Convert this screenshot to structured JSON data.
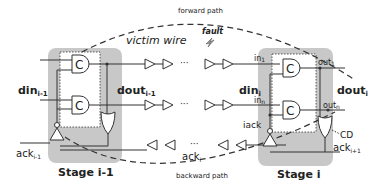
{
  "labels": {
    "forward_path": "forward path",
    "backward_path": "backward path",
    "victim_wire": "victim wire",
    "fault": "fault",
    "din_prev": "din",
    "din_prev_sub": "i-1",
    "dout_prev": "dout",
    "dout_prev_sub": "i-1",
    "din_cur": "din",
    "din_cur_sub": "i",
    "dout_cur": "dout",
    "dout_cur_sub": "i",
    "in1": "in",
    "in1_sub": "1",
    "inn": "in",
    "inn_sub": "n",
    "out1": "out",
    "out1_sub": "1",
    "outn": "out",
    "outn_sub": "n",
    "iack": "iack",
    "cd": "CD",
    "ack_prev": "ack",
    "ack_prev_sub": "i-1",
    "ack_cur": "ack",
    "ack_cur_sub": "i",
    "ack_next": "ack",
    "ack_next_sub": "i+1",
    "stage_prev": "Stage i-1",
    "stage_cur": "Stage i",
    "c_gate": "C",
    "ellipsis": "···",
    "vdots": "⋮"
  },
  "colors": {
    "stage_fill": "#c8c8c8",
    "wire": "#333333",
    "text": "#222222"
  }
}
